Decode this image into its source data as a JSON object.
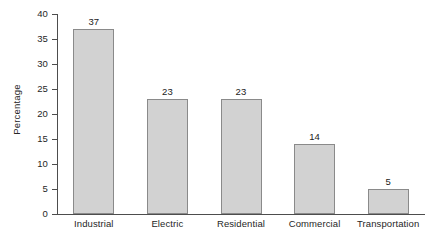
{
  "chart_data": {
    "type": "bar",
    "title": "",
    "xlabel": "",
    "ylabel": "Percentage",
    "categories": [
      "Industrial",
      "Electric",
      "Residential",
      "Commercial",
      "Transportation"
    ],
    "values": [
      37,
      23,
      23,
      14,
      5
    ],
    "value_labels": [
      "37",
      "23",
      "23",
      "14",
      "5"
    ],
    "ylim": [
      0,
      40
    ],
    "y_ticks": [
      0,
      5,
      10,
      15,
      20,
      25,
      30,
      35,
      40
    ],
    "y_tick_labels": [
      "0",
      "5",
      "10",
      "15",
      "20",
      "25",
      "30",
      "35",
      "40"
    ],
    "grid": false,
    "legend": false,
    "legend_position": "none",
    "bar_fill_color": "#d2d2d2",
    "bar_border_color": "#8a8a8a",
    "axis_color": "#4d4d4d",
    "background_color": "#ffffff"
  }
}
